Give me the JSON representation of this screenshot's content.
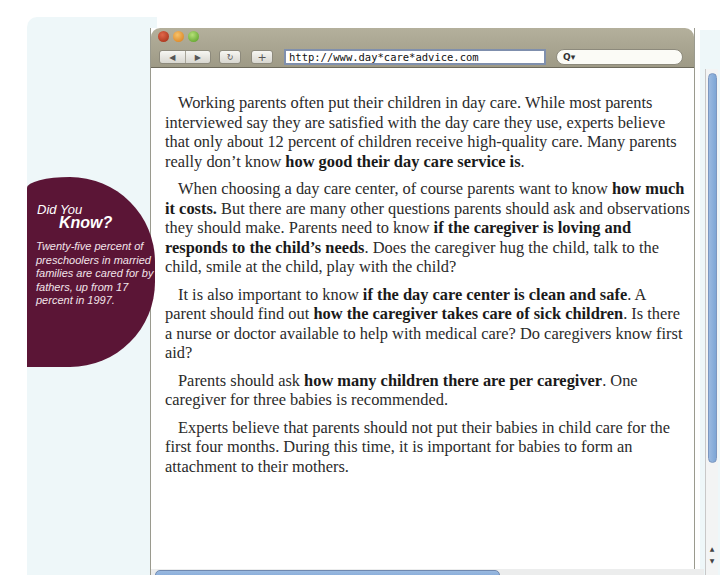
{
  "browser": {
    "url": "http://www.day*care*advice.com",
    "search_placeholder": "",
    "search_icon_label": "Q▾",
    "back_label": "◀",
    "forward_label": "▶",
    "reload_label": "↻",
    "add_label": "+"
  },
  "sidebar_callout": {
    "title_line1": "Did You",
    "title_line2": "Know?",
    "body": "Twenty-five percent of preschoolers in married families are cared for by fathers, up from 17 percent in 1997."
  },
  "article": {
    "paragraphs": [
      {
        "segments": [
          {
            "text": "Working parents often put their children in day care. While most parents interviewed say they are satisfied with the day care they use, experts believe that only about 12 percent of children receive high-quality care. Many parents really don’t know ",
            "bold": false
          },
          {
            "text": "how good their day care service is",
            "bold": true
          },
          {
            "text": ".",
            "bold": false
          }
        ]
      },
      {
        "segments": [
          {
            "text": "When choosing a day care center, of course parents want to know ",
            "bold": false
          },
          {
            "text": "how much it costs.",
            "bold": true
          },
          {
            "text": " But there are many other questions parents should ask and observations they should make. Parents need to know ",
            "bold": false
          },
          {
            "text": "if the caregiver is loving and responds to the child’s needs",
            "bold": true
          },
          {
            "text": ". Does the caregiver hug the child, talk to the child, smile at the child, play with the child?",
            "bold": false
          }
        ]
      },
      {
        "segments": [
          {
            "text": "It is also important to know ",
            "bold": false
          },
          {
            "text": "if the day care center is clean and safe",
            "bold": true
          },
          {
            "text": ". A parent should find out ",
            "bold": false
          },
          {
            "text": "how the caregiver takes care of sick children",
            "bold": true
          },
          {
            "text": ". Is there a nurse or doctor available to help with medical care? Do caregivers know first aid?",
            "bold": false
          }
        ]
      },
      {
        "segments": [
          {
            "text": "Parents should ask ",
            "bold": false
          },
          {
            "text": "how many children there are per caregiver",
            "bold": true
          },
          {
            "text": ". One caregiver for three babies is recommended.",
            "bold": false
          }
        ]
      },
      {
        "segments": [
          {
            "text": "Experts believe that parents should not put their babies in child care for the first four months. During this time, it is important for babies to form an attachment to their mothers.",
            "bold": false
          }
        ]
      }
    ]
  },
  "scrollbar": {
    "up_label": "▲",
    "down_label": "▼"
  },
  "colors": {
    "callout_bg": "#5b1536",
    "panel_bg": "#eef7f9",
    "toolbar": "#a9a591",
    "scroll_thumb": "#8cb0dc"
  }
}
